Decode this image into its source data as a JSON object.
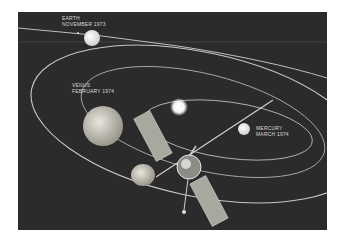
{
  "image": {
    "subject": "Mariner 10 spacecraft mission illustration",
    "colors": {
      "background": "#2b2b2b",
      "orbit": "#d0d0d0",
      "sun": "#ffffff",
      "page": "#ffffff"
    }
  },
  "labels": {
    "earth": {
      "name": "EARTH",
      "date": "NOVEMBER 1973"
    },
    "venus": {
      "name": "VENUS",
      "date": "FEBRUARY 1974"
    },
    "mercury": {
      "name": "MERCURY",
      "date": "MARCH 1974"
    }
  }
}
